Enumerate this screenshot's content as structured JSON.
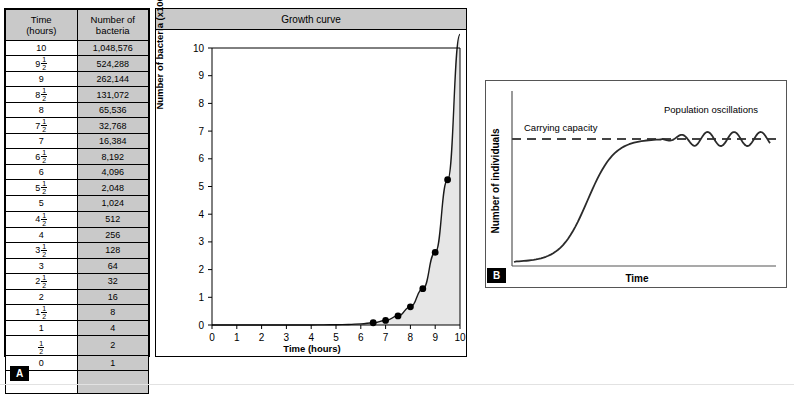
{
  "panel_a": {
    "letter": "A",
    "chart_title": "Growth curve",
    "table": {
      "headers": [
        "Time (hours)",
        "Number of bacteria"
      ],
      "header_line1": [
        "Time",
        "Number of"
      ],
      "header_line2": [
        "(hours)",
        "bacteria"
      ],
      "rows": [
        {
          "time": "10",
          "time_whole": "10",
          "time_frac": "",
          "bacteria": "1,048,576"
        },
        {
          "time": "9 1/2",
          "time_whole": "9",
          "time_frac": "1/2",
          "bacteria": "524,288"
        },
        {
          "time": "9",
          "time_whole": "9",
          "time_frac": "",
          "bacteria": "262,144"
        },
        {
          "time": "8 1/2",
          "time_whole": "8",
          "time_frac": "1/2",
          "bacteria": "131,072"
        },
        {
          "time": "8",
          "time_whole": "8",
          "time_frac": "",
          "bacteria": "65,536"
        },
        {
          "time": "7 1/2",
          "time_whole": "7",
          "time_frac": "1/2",
          "bacteria": "32,768"
        },
        {
          "time": "7",
          "time_whole": "7",
          "time_frac": "",
          "bacteria": "16,384"
        },
        {
          "time": "6 1/2",
          "time_whole": "6",
          "time_frac": "1/2",
          "bacteria": "8,192"
        },
        {
          "time": "6",
          "time_whole": "6",
          "time_frac": "",
          "bacteria": "4,096"
        },
        {
          "time": "5 1/2",
          "time_whole": "5",
          "time_frac": "1/2",
          "bacteria": "2,048"
        },
        {
          "time": "5",
          "time_whole": "5",
          "time_frac": "",
          "bacteria": "1,024"
        },
        {
          "time": "4 1/2",
          "time_whole": "4",
          "time_frac": "1/2",
          "bacteria": "512"
        },
        {
          "time": "4",
          "time_whole": "4",
          "time_frac": "",
          "bacteria": "256"
        },
        {
          "time": "3 1/2",
          "time_whole": "3",
          "time_frac": "1/2",
          "bacteria": "128"
        },
        {
          "time": "3",
          "time_whole": "3",
          "time_frac": "",
          "bacteria": "64"
        },
        {
          "time": "2 1/2",
          "time_whole": "2",
          "time_frac": "1/2",
          "bacteria": "32"
        },
        {
          "time": "2",
          "time_whole": "2",
          "time_frac": "",
          "bacteria": "16"
        },
        {
          "time": "1 1/2",
          "time_whole": "1",
          "time_frac": "1/2",
          "bacteria": "8"
        },
        {
          "time": "1",
          "time_whole": "1",
          "time_frac": "",
          "bacteria": "4"
        },
        {
          "time": "1/2",
          "time_whole": "",
          "time_frac": "1/2",
          "bacteria": "2"
        },
        {
          "time": "0",
          "time_whole": "0",
          "time_frac": "",
          "bacteria": "1"
        }
      ]
    }
  },
  "panel_b": {
    "letter": "B",
    "ylabel": "Number of individuals",
    "xlabel": "Time",
    "annotations": {
      "carrying_capacity": "Carrying capacity",
      "population_oscillations": "Population oscillations"
    }
  },
  "colors": {
    "header_gray": "#c9c9c9",
    "fill_gray": "#e6e6e6",
    "curve": "#1a1a1a",
    "frame": "#000000"
  },
  "chart_data": [
    {
      "type": "line",
      "id": "growth-curve",
      "title": "Growth curve",
      "xlabel": "Time (hours)",
      "ylabel": "Number of bacteria (x100,000)",
      "xlim": [
        0,
        10
      ],
      "ylim": [
        0,
        10
      ],
      "xticks": [
        0,
        1,
        2,
        3,
        4,
        5,
        6,
        7,
        8,
        9,
        10
      ],
      "yticks": [
        0,
        1,
        2,
        3,
        4,
        5,
        6,
        7,
        8,
        9,
        10
      ],
      "grid": false,
      "legend": "none",
      "area_fill": true,
      "x": [
        0,
        0.5,
        1,
        1.5,
        2,
        2.5,
        3,
        3.5,
        4,
        4.5,
        5,
        5.5,
        6,
        6.5,
        7,
        7.5,
        8,
        8.5,
        9,
        9.5,
        10
      ],
      "y": [
        1e-05,
        2e-05,
        4e-05,
        8e-05,
        0.00016,
        0.00032,
        0.00064,
        0.00128,
        0.00256,
        0.00512,
        0.01024,
        0.02048,
        0.04096,
        0.08192,
        0.16384,
        0.32768,
        0.65536,
        1.31072,
        2.62144,
        5.24288,
        10.48576
      ],
      "markers_from_x": 6.5,
      "marker_x": [
        6.5,
        7,
        7.5,
        8,
        8.5,
        9,
        9.5
      ],
      "marker_y": [
        0.08192,
        0.16384,
        0.32768,
        0.65536,
        1.31072,
        2.62144,
        5.24288
      ]
    },
    {
      "type": "line",
      "id": "logistic-curve",
      "title": "",
      "xlabel": "Time",
      "ylabel": "Number of individuals",
      "grid": false,
      "legend": "none",
      "carrying_capacity_level": 0.82,
      "annotations": [
        "Carrying capacity",
        "Population oscillations"
      ]
    }
  ]
}
